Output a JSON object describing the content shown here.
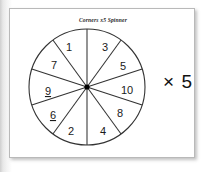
{
  "card": {
    "title": "Corners x5 Spinner",
    "background_color": "#ffffff",
    "border_color": "#b9b9b9"
  },
  "spinner": {
    "name": "ten-segment-spinner",
    "segment_count": 10,
    "stroke_color": "#333333",
    "fill_color": "#ffffff",
    "hub_color": "#000000",
    "segments": [
      {
        "label": "1",
        "underlined": false,
        "position": "top-left-inner"
      },
      {
        "label": "3",
        "underlined": false,
        "position": "top-right-inner"
      },
      {
        "label": "5",
        "underlined": false,
        "position": "upper-right"
      },
      {
        "label": "10",
        "underlined": false,
        "position": "right"
      },
      {
        "label": "8",
        "underlined": false,
        "position": "lower-right"
      },
      {
        "label": "4",
        "underlined": false,
        "position": "bottom-right-inner"
      },
      {
        "label": "2",
        "underlined": false,
        "position": "bottom-left-inner"
      },
      {
        "label": "6",
        "underlined": true,
        "position": "lower-left"
      },
      {
        "label": "9",
        "underlined": true,
        "position": "left"
      },
      {
        "label": "7",
        "underlined": false,
        "position": "upper-left"
      }
    ]
  },
  "multiplier": {
    "text": "× 5",
    "value": 5,
    "symbol": "×"
  }
}
